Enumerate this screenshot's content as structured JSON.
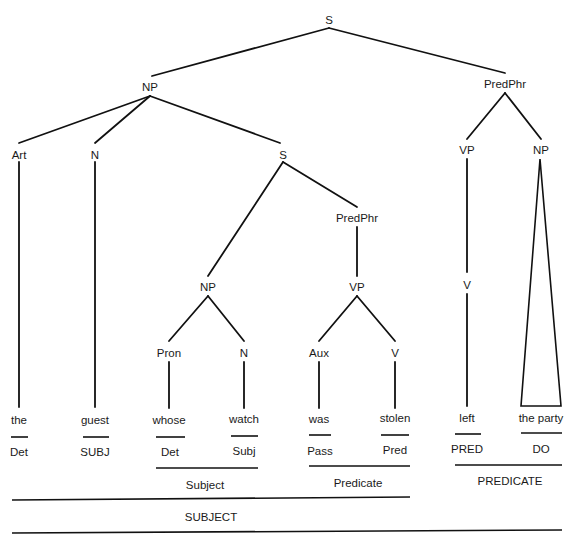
{
  "diagram": {
    "type": "syntax-tree",
    "sentence": "the guest whose watch was stolen left the party",
    "nodes": {
      "root_s": "S",
      "np_main": "NP",
      "predphr_main": "PredPhr",
      "art": "Art",
      "n_main": "N",
      "s_rel": "S",
      "vp_main": "VP",
      "np_obj": "NP",
      "predphr_rel": "PredPhr",
      "np_rel": "NP",
      "vp_rel": "VP",
      "v_main": "V",
      "pron": "Pron",
      "n_rel": "N",
      "aux": "Aux",
      "v_rel": "V"
    },
    "leaves": [
      {
        "word": "the",
        "function": "Det"
      },
      {
        "word": "guest",
        "function": "SUBJ"
      },
      {
        "word": "whose",
        "function": "Det"
      },
      {
        "word": "watch",
        "function": "Subj"
      },
      {
        "word": "was",
        "function": "Pass"
      },
      {
        "word": "stolen",
        "function": "Pred"
      },
      {
        "word": "left",
        "function": "PRED"
      },
      {
        "word": "the party",
        "function": "DO"
      }
    ],
    "groupings": {
      "rel_subject": "Subject",
      "rel_predicate": "Predicate",
      "main_predicate": "PREDICATE",
      "main_subject": "SUBJECT"
    }
  }
}
